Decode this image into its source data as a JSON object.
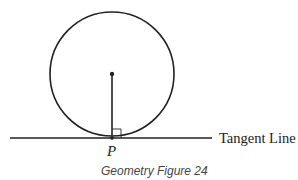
{
  "figure": {
    "caption": "Geometry Figure 24",
    "point_label": "P",
    "line_label": "Tangent Line",
    "colors": {
      "stroke": "#222222",
      "caption": "#444444",
      "background": "#ffffff"
    },
    "circle": {
      "cx": 112,
      "cy": 74,
      "r": 62
    },
    "tangent_line": {
      "x1": 10,
      "y1": 138,
      "x2": 212,
      "y2": 138
    },
    "radius_segment": {
      "x1": 112,
      "y1": 74,
      "x2": 112,
      "y2": 138
    },
    "right_angle_marker": {
      "x": 112,
      "y": 129,
      "size": 9
    }
  }
}
